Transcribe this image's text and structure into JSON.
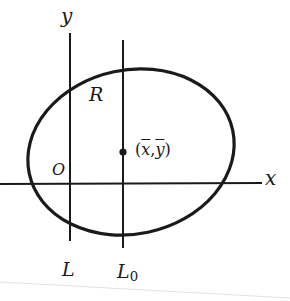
{
  "diagram": {
    "colors": {
      "ink": "#1a1a1a",
      "background": "#ffffff",
      "page_edge": "#dcdcdc"
    },
    "axes": {
      "x_label": "x",
      "y_label": "y",
      "origin_label": "O"
    },
    "region_label": "R",
    "centroid": {
      "open": "(",
      "x": "x",
      "sep": ",",
      "y": "y",
      "close": ")"
    },
    "lines": {
      "L": {
        "label": "L"
      },
      "L0": {
        "label": "L",
        "subscript": "0"
      }
    }
  }
}
